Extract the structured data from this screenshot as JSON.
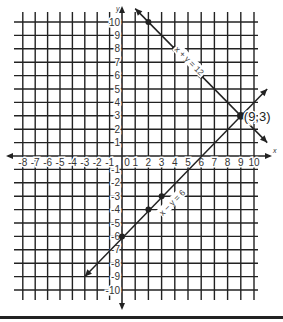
{
  "chart_data": {
    "type": "line",
    "title": "",
    "xlabel": "x",
    "ylabel": "y",
    "xlim": [
      -8,
      10
    ],
    "ylim": [
      -10,
      10
    ],
    "grid": true,
    "x_ticks": [
      -8,
      -7,
      -6,
      -5,
      -4,
      -3,
      -2,
      -1,
      0,
      1,
      2,
      3,
      4,
      5,
      6,
      7,
      8,
      9,
      10
    ],
    "y_ticks": [
      -10,
      -9,
      -8,
      -7,
      -6,
      -5,
      -4,
      -3,
      -2,
      -1,
      1,
      2,
      3,
      4,
      5,
      6,
      7,
      8,
      9,
      10
    ],
    "series": [
      {
        "name": "x + y = 12",
        "label": "x + y = 12",
        "equation": "y = 12 - x",
        "points": [
          [
            2,
            10
          ],
          [
            4,
            8
          ],
          [
            6,
            6
          ],
          [
            9,
            3
          ]
        ],
        "line_extent": [
          [
            1,
            11
          ],
          [
            11,
            1
          ]
        ]
      },
      {
        "name": "x − y = 6",
        "label": "x − y = 6",
        "equation": "y = x - 6",
        "points": [
          [
            0,
            -6
          ],
          [
            2,
            -4
          ],
          [
            3,
            -3
          ],
          [
            9,
            3
          ]
        ],
        "line_extent": [
          [
            -3,
            -9
          ],
          [
            11,
            5
          ]
        ]
      }
    ],
    "annotations": [
      {
        "text": "(9,3)",
        "x": 9,
        "y": 3,
        "type": "intersection"
      }
    ]
  },
  "labels": {
    "axis_x": "x",
    "axis_y": "y",
    "intersection": "(9,3)",
    "eq1": "x + y = 12",
    "eq2": "x − y = 6"
  }
}
